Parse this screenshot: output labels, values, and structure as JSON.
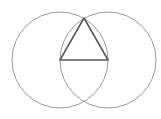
{
  "diagram": {
    "circles": [
      {
        "name": "left-circle",
        "cx": 60,
        "cy": 60,
        "r": 48,
        "stroke": "#9a9a9a"
      },
      {
        "name": "right-circle",
        "cx": 108,
        "cy": 60,
        "r": 48,
        "stroke": "#9a9a9a"
      }
    ],
    "triangle": {
      "points": "60,60 108,60 84,18",
      "stroke": "#5a5a5a"
    },
    "base_segment": {
      "x1": 60,
      "y1": 60,
      "x2": 108,
      "y2": 60
    }
  }
}
